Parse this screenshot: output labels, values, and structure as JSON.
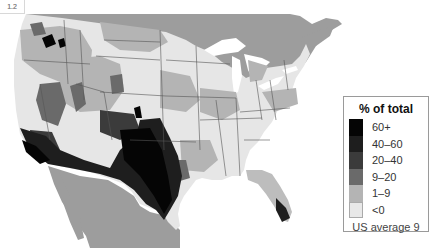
{
  "figure": {
    "label": "1.2"
  },
  "map": {
    "title": "% of total",
    "region": "United States (contiguous), counties",
    "colors": {
      "water": "#ffffff",
      "neighbor_land": "#9d9d9d",
      "state_border": "#555555"
    }
  },
  "legend": {
    "title": "% of total",
    "items": [
      {
        "label": "60+",
        "color": "#050505"
      },
      {
        "label": "40–60",
        "color": "#1e1e1e"
      },
      {
        "label": "20–40",
        "color": "#3b3b3b"
      },
      {
        "label": "9–20",
        "color": "#6a6a6a"
      },
      {
        "label": "1–9",
        "color": "#b4b4b4"
      },
      {
        "label": "<0",
        "color": "#e8e8e8"
      }
    ],
    "footnote": "US average 9"
  }
}
